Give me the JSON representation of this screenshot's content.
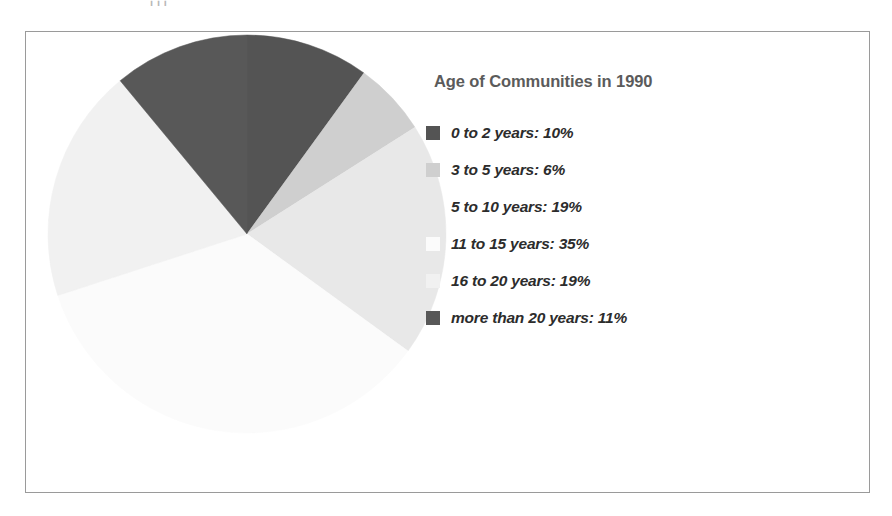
{
  "page": {
    "cut_off_text_above_figure": "i i i"
  },
  "figure": {
    "frame_border_color": "#9a9a9a",
    "background": "#ffffff"
  },
  "legend": {
    "title": "Age of Communities in 1990",
    "title_color": "#5b5b5b",
    "label_color": "#2c2c2c"
  },
  "chart_data": {
    "type": "pie",
    "title": "Age of Communities in 1990",
    "xlabel": "",
    "ylabel": "",
    "grid": false,
    "legend_position": "right",
    "start_angle_deg": 0,
    "direction": "clockwise",
    "unit": "%",
    "categories": [
      "0 to 2 years",
      "3 to 5 years",
      "5 to 10 years",
      "11 to 15 years",
      "16 to 20 years",
      "more than 20 years"
    ],
    "values": [
      10,
      6,
      19,
      35,
      19,
      11
    ],
    "colors": [
      "#545454",
      "#cfcfcf",
      "#e8e8e8",
      "#fbfbfb",
      "#f1f1f1",
      "#585858"
    ],
    "slices": [
      {
        "label": "0 to 2 years",
        "value": 10,
        "legend_text": "0 to 2 years: 10%",
        "color": "#545454"
      },
      {
        "label": "3 to 5 years",
        "value": 6,
        "legend_text": "3 to 5 years: 6%",
        "color": "#cfcfcf"
      },
      {
        "label": "5 to 10 years",
        "value": 19,
        "legend_text": "5 to 10 years: 19%",
        "color": "#e8e8e8"
      },
      {
        "label": "11 to 15 years",
        "value": 35,
        "legend_text": "11 to 15 years: 35%",
        "color": "#fbfbfb"
      },
      {
        "label": "16 to 20 years",
        "value": 19,
        "legend_text": "16 to 20 years: 19%",
        "color": "#f1f1f1"
      },
      {
        "label": "more than 20 years",
        "value": 11,
        "legend_text": "more than 20 years: 11%",
        "color": "#585858"
      }
    ]
  }
}
